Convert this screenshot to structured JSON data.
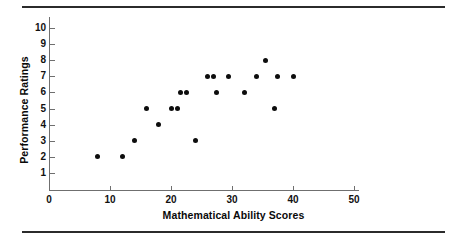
{
  "figure": {
    "rules": [
      "top-rule",
      "bottom-rule"
    ]
  },
  "chart_data": {
    "type": "scatter",
    "title": "",
    "subtitle": "",
    "xlabel": "Mathematical Ability Scores",
    "ylabel": "Performance Ratings",
    "xlim": [
      0,
      52
    ],
    "ylim": [
      0,
      10.6
    ],
    "xticks": [
      0,
      10,
      20,
      30,
      40,
      50
    ],
    "xtick_labels": [
      "0",
      "10",
      "20",
      "30",
      "40",
      "50"
    ],
    "yticks": [
      1,
      2,
      3,
      4,
      5,
      6,
      7,
      8,
      9,
      10
    ],
    "ytick_labels": [
      "1",
      "2",
      "3",
      "4",
      "5",
      "6",
      "7",
      "8",
      "9",
      "10"
    ],
    "grid": false,
    "legend": null,
    "marker": "filled-circle",
    "marker_color": "#0d0d0d",
    "axis_color": "#6f6f6f",
    "points": [
      {
        "x": 8,
        "y": 2
      },
      {
        "x": 12,
        "y": 2
      },
      {
        "x": 14,
        "y": 3
      },
      {
        "x": 16,
        "y": 5
      },
      {
        "x": 18,
        "y": 4
      },
      {
        "x": 20,
        "y": 5
      },
      {
        "x": 21,
        "y": 5
      },
      {
        "x": 21.5,
        "y": 6
      },
      {
        "x": 22.5,
        "y": 6
      },
      {
        "x": 24,
        "y": 3
      },
      {
        "x": 26,
        "y": 7
      },
      {
        "x": 27,
        "y": 7
      },
      {
        "x": 27.5,
        "y": 6
      },
      {
        "x": 29.5,
        "y": 7
      },
      {
        "x": 32,
        "y": 6
      },
      {
        "x": 34,
        "y": 7
      },
      {
        "x": 35.5,
        "y": 8
      },
      {
        "x": 37,
        "y": 5
      },
      {
        "x": 37.5,
        "y": 7
      },
      {
        "x": 40,
        "y": 7
      }
    ]
  }
}
